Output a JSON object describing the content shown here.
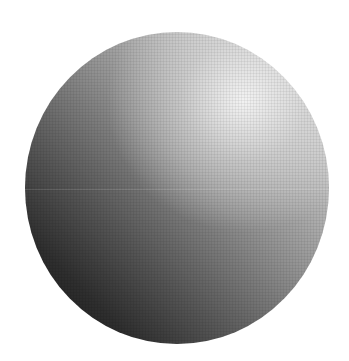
{
  "image": {
    "subject": "gray gradient sphere",
    "background_color": "#ffffff",
    "shape": "circle",
    "gradient": {
      "direction": "top-right to bottom-left",
      "light_color": "#f2f2f2",
      "mid_color": "#8f8f8f",
      "dark_color": "#161616"
    }
  }
}
